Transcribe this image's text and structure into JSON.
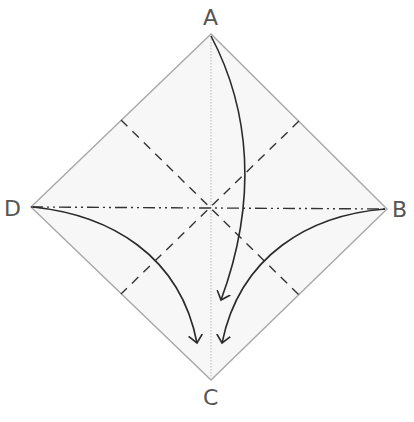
{
  "diagram": {
    "type": "origami-fold-diagram",
    "vertices": {
      "A": {
        "label": "A",
        "x": 211,
        "y": 34
      },
      "B": {
        "label": "B",
        "x": 387,
        "y": 209
      },
      "C": {
        "label": "C",
        "x": 211,
        "y": 380
      },
      "D": {
        "label": "D",
        "x": 31,
        "y": 207
      }
    },
    "colors": {
      "paper_fill": "#f7f7f7",
      "paper_edge": "#a8a8a8",
      "fold_line": "#333333",
      "arrow": "#2a2a2a",
      "label": "#555555",
      "center_crease": "#bbbbbb"
    },
    "lines": [
      {
        "name": "mountain-fold-D-B",
        "style": "dash-dot-dot",
        "from": "D",
        "to": "B"
      },
      {
        "name": "center-crease-A-C",
        "style": "thin-dotted",
        "from": "A",
        "to": "C"
      },
      {
        "name": "valley-fold-diagonal-1",
        "style": "dashed"
      },
      {
        "name": "valley-fold-diagonal-2",
        "style": "dashed"
      }
    ],
    "arrows": [
      {
        "name": "arrow-A-to-C",
        "from": "A",
        "to": "C"
      },
      {
        "name": "arrow-D-to-C",
        "from": "D",
        "to": "C"
      },
      {
        "name": "arrow-B-to-C",
        "from": "B",
        "to": "C"
      }
    ]
  }
}
